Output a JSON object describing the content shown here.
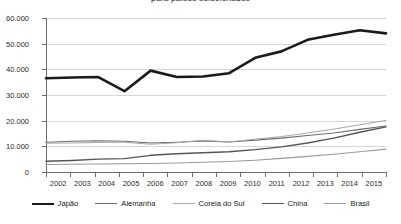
{
  "chart_data": {
    "type": "line",
    "title": "para países selecionados",
    "xlabel": "",
    "ylabel": "",
    "grid": true,
    "legend_position": "bottom",
    "x": [
      "2002",
      "2003",
      "2004",
      "2005",
      "2006",
      "2007",
      "2008",
      "2009",
      "2010",
      "2011",
      "2012",
      "2013",
      "2014",
      "2015"
    ],
    "categories": [
      "2002",
      "2003",
      "2004",
      "2005",
      "2006",
      "2007",
      "2008",
      "2009",
      "2010",
      "2011",
      "2012",
      "2013",
      "2014",
      "2015"
    ],
    "ylim": [
      0,
      60000
    ],
    "yticks": [
      0,
      10000,
      20000,
      30000,
      40000,
      50000,
      60000
    ],
    "ytick_labels": [
      "0",
      "10.000",
      "20.000",
      "30.000",
      "40.000",
      "50.000",
      "60.000"
    ],
    "series": [
      {
        "name": "Japão",
        "color": "#1a1a1a",
        "width": 2.6,
        "values": [
          36500,
          36800,
          37000,
          31500,
          39500,
          37000,
          37200,
          38500,
          44500,
          47000,
          51500,
          53500,
          55200,
          54000
        ]
      },
      {
        "name": "Alemanha",
        "color": "#6b6b6b",
        "width": 1.1,
        "values": [
          11600,
          12000,
          12200,
          12000,
          11300,
          11600,
          12100,
          11700,
          12400,
          13200,
          14200,
          15200,
          16600,
          17900
        ]
      },
      {
        "name": "Coreia do Sul",
        "color": "#a8a8a8",
        "width": 1.0,
        "values": [
          11200,
          11300,
          11500,
          11600,
          10800,
          11400,
          12400,
          11700,
          12800,
          13800,
          15200,
          16700,
          18400,
          20100
        ]
      },
      {
        "name": "China",
        "color": "#555555",
        "width": 1.4,
        "values": [
          4200,
          4500,
          5000,
          5200,
          6500,
          7100,
          7500,
          7900,
          8700,
          9800,
          11300,
          13200,
          15500,
          17600
        ]
      },
      {
        "name": "Brasil",
        "color": "#9a9a9a",
        "width": 1.1,
        "values": [
          2900,
          3000,
          3100,
          3200,
          3300,
          3500,
          3800,
          4100,
          4600,
          5300,
          6100,
          6900,
          7900,
          8900
        ]
      }
    ]
  },
  "legend": {
    "items": [
      {
        "label": "Japão"
      },
      {
        "label": "Alemanha"
      },
      {
        "label": "Coreia do Sul"
      },
      {
        "label": "China"
      },
      {
        "label": "Brasil"
      }
    ]
  }
}
